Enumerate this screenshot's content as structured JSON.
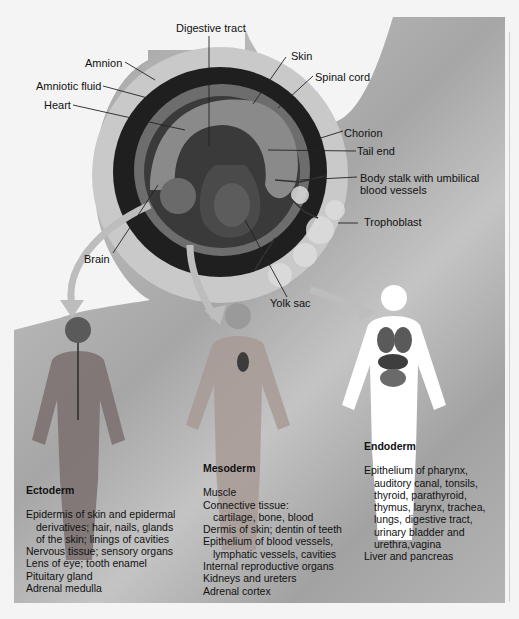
{
  "figure": {
    "background_colors": {
      "page": "#f4f4f4",
      "panel": "#ababab",
      "embryo_dark": "#1e1e1e",
      "membrane": "#c8c8c8"
    },
    "embryo_labels": {
      "digestive_tract": "Digestive tract",
      "amnion": "Amnion",
      "amniotic_fluid": "Amniotic fluid",
      "heart": "Heart",
      "skin": "Skin",
      "spinal_cord": "Spinal cord",
      "chorion": "Chorion",
      "tail_end": "Tail end",
      "body_stalk_line1": "Body stalk with umbilical",
      "body_stalk_line2": "blood vessels",
      "trophoblast": "Trophoblast",
      "brain": "Brain",
      "yolk_sac": "Yolk sac"
    },
    "germ_layers": [
      {
        "title": "Ectoderm",
        "items": [
          {
            "text": "Epidermis of skin and epidermal"
          },
          {
            "text": "derivatives; hair, nails, glands",
            "indent": true
          },
          {
            "text": "of the skin; linings of cavities",
            "indent": true
          },
          {
            "text": "Nervous tissue; sensory organs"
          },
          {
            "text": "Lens of eye; tooth enamel"
          },
          {
            "text": "Pituitary gland"
          },
          {
            "text": "Adrenal medulla"
          }
        ]
      },
      {
        "title": "Mesoderm",
        "items": [
          {
            "text": "Muscle"
          },
          {
            "text": "Connective tissue:"
          },
          {
            "text": "cartilage, bone, blood",
            "indent": true
          },
          {
            "text": "Dermis of skin; dentin of teeth"
          },
          {
            "text": "Epithelium of blood vessels,"
          },
          {
            "text": "lymphatic vessels, cavities",
            "indent": true
          },
          {
            "text": "Internal reproductive organs"
          },
          {
            "text": "Kidneys and ureters"
          },
          {
            "text": "Adrenal cortex"
          }
        ]
      },
      {
        "title": "Endoderm",
        "items": [
          {
            "text": "Epithelium of pharynx,"
          },
          {
            "text": "auditory canal, tonsils,",
            "indent": true
          },
          {
            "text": "thyroid, parathyroid,",
            "indent": true
          },
          {
            "text": "thymus, larynx, trachea,",
            "indent": true
          },
          {
            "text": "lungs, digestive tract,",
            "indent": true
          },
          {
            "text": "urinary bladder and",
            "indent": true
          },
          {
            "text": "urethra,vagina",
            "indent": true
          },
          {
            "text": "Liver and pancreas"
          }
        ]
      }
    ]
  }
}
